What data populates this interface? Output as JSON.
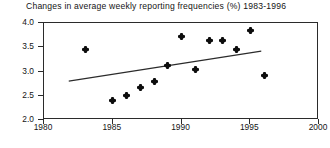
{
  "chart_data": {
    "type": "scatter",
    "title": "Changes in average weekly reporting frequencies (%) 1983-1996",
    "xlabel": "",
    "ylabel": "",
    "xlim": [
      1980,
      2000
    ],
    "ylim": [
      2.0,
      4.0
    ],
    "xticks": [
      1980,
      1985,
      1990,
      1995,
      2000
    ],
    "xtick_labels": [
      "1980",
      "1985",
      "1990",
      "1995",
      "2000"
    ],
    "yticks": [
      2.0,
      2.5,
      3.0,
      3.5,
      4.0
    ],
    "ytick_labels": [
      "2.0",
      "2.5",
      "3.0",
      "3.5",
      "4.0"
    ],
    "grid": false,
    "legend": null,
    "marker": "diamond-plus",
    "marker_color": "#0d0d0d",
    "x": [
      1983,
      1985,
      1986,
      1987,
      1988,
      1989,
      1990,
      1991,
      1992,
      1993,
      1994,
      1995,
      1996
    ],
    "values": [
      3.45,
      2.4,
      2.5,
      2.66,
      2.8,
      3.13,
      3.73,
      3.05,
      3.63,
      3.63,
      3.46,
      3.85,
      2.91
    ],
    "points": [
      {
        "x": 1983,
        "y": 3.45
      },
      {
        "x": 1985,
        "y": 2.4
      },
      {
        "x": 1986,
        "y": 2.5
      },
      {
        "x": 1987,
        "y": 2.66
      },
      {
        "x": 1988,
        "y": 2.8
      },
      {
        "x": 1989,
        "y": 3.13
      },
      {
        "x": 1990,
        "y": 3.73
      },
      {
        "x": 1991,
        "y": 3.05
      },
      {
        "x": 1992,
        "y": 3.63
      },
      {
        "x": 1993,
        "y": 3.63
      },
      {
        "x": 1994,
        "y": 3.46
      },
      {
        "x": 1995,
        "y": 3.85
      },
      {
        "x": 1996,
        "y": 2.91
      }
    ],
    "trendline": {
      "type": "linear",
      "x_start": 1981.8,
      "y_start": 2.8,
      "x_end": 1995.8,
      "y_end": 3.42,
      "color": "#2b2b2b"
    }
  }
}
